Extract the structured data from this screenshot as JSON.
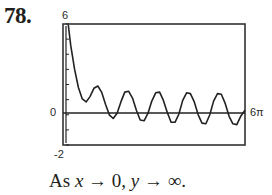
{
  "problem_number": "78.",
  "caption": {
    "prefix": "As ",
    "var_x": "x",
    "arrow1": " → 0, ",
    "var_y": "y",
    "arrow2": " → ∞."
  },
  "chart_data": {
    "type": "line",
    "title": "",
    "xlabel": "",
    "ylabel": "",
    "xlim": [
      0,
      18.85
    ],
    "ylim": [
      -2,
      6
    ],
    "x_tick_labels": {
      "right": "6π"
    },
    "y_tick_labels": {
      "top": "6",
      "zero": "0",
      "bottom": "-2"
    },
    "grid": false,
    "y_ticks_count": 9,
    "series": [
      {
        "name": "f(x)",
        "x": [
          0.55,
          0.8,
          1.2,
          1.6,
          2.0,
          2.4,
          2.8,
          3.2,
          3.6,
          4.0,
          4.4,
          4.8,
          5.2,
          5.6,
          6.0,
          6.4,
          6.8,
          7.2,
          7.6,
          8.0,
          8.4,
          8.8,
          9.2,
          9.6,
          10.0,
          10.4,
          10.8,
          11.2,
          11.6,
          12.0,
          12.4,
          12.8,
          13.2,
          13.6,
          14.0,
          14.4,
          14.8,
          15.2,
          15.6,
          16.0,
          16.4,
          16.8,
          17.2,
          17.6,
          18.0,
          18.4,
          18.85
        ],
        "y": [
          6.0,
          4.6,
          3.0,
          1.8,
          1.05,
          0.85,
          1.2,
          1.75,
          1.9,
          1.5,
          0.7,
          0.0,
          -0.25,
          0.1,
          0.85,
          1.5,
          1.55,
          1.1,
          0.3,
          -0.35,
          -0.4,
          0.1,
          0.9,
          1.45,
          1.5,
          0.95,
          0.15,
          -0.5,
          -0.5,
          0.05,
          0.95,
          1.45,
          1.4,
          0.85,
          0.0,
          -0.55,
          -0.6,
          0.0,
          0.9,
          1.4,
          1.35,
          0.75,
          -0.1,
          -0.6,
          -0.65,
          -0.1,
          0.3
        ]
      }
    ]
  },
  "colors": {
    "ink": "#231f20",
    "frame": "#333333"
  }
}
